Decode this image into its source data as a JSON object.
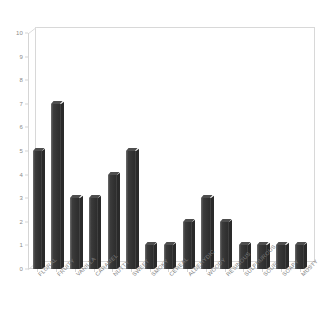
{
  "chart_data": {
    "type": "bar",
    "title": "",
    "subtitle": "",
    "xlabel": "",
    "ylabel": "",
    "categories": [
      "FLORAL",
      "FRUITY",
      "VANILLA",
      "CARAMEL",
      "NUTTY",
      "SWEET",
      "SMOKY",
      "CEREAL",
      "ALDEHYDIC",
      "WOODY",
      "RESINOUS",
      "SULPHUROUS",
      "SOUR",
      "SOAPY",
      "MUSTY"
    ],
    "values": [
      5,
      7,
      3,
      3,
      4,
      5,
      1,
      1,
      2,
      3,
      2,
      1,
      1,
      1,
      1
    ],
    "ylim": [
      0,
      10
    ],
    "ytick_labels": [
      "0",
      "1",
      "2",
      "3",
      "4",
      "5",
      "6",
      "7",
      "8",
      "9",
      "10"
    ],
    "ytick_values": [
      0,
      1,
      2,
      3,
      4,
      5,
      6,
      7,
      8,
      9,
      10
    ],
    "grid": false,
    "legend": null,
    "legend_position": "none",
    "annotations": [],
    "style": {
      "bar_color": "#333333",
      "bar_highlight": "#6e6e6e",
      "bar_shadow": "#2a2a2a",
      "axis_color": "#d5d5d5",
      "tick_label_color": "#7e7e7e",
      "background": "#ffffff",
      "three_d": true,
      "xlabel_rotation_deg": -45
    }
  }
}
